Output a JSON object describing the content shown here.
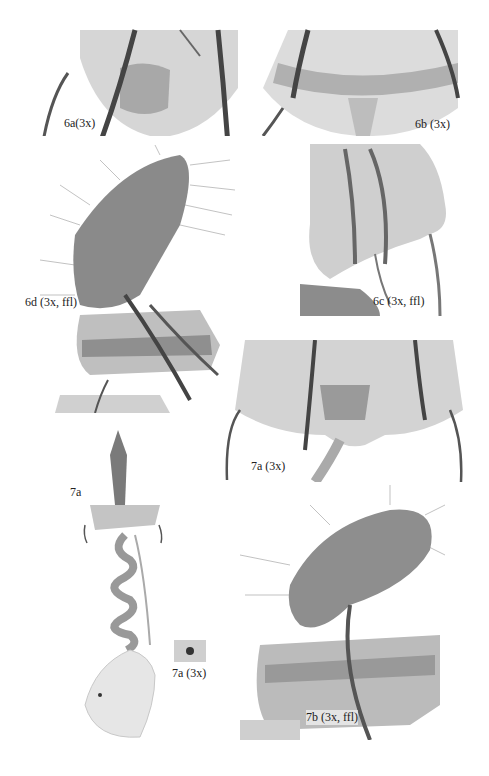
{
  "figure": {
    "panels": [
      {
        "id": "6a",
        "label": "6a(3x)"
      },
      {
        "id": "6b",
        "label": "6b (3x)"
      },
      {
        "id": "6d",
        "label": "6d (3x, ffl)"
      },
      {
        "id": "6c",
        "label": "6c (3x, ffl)"
      },
      {
        "id": "7a-3x-sterigma",
        "label": "7a (3x)"
      },
      {
        "id": "7a-whole",
        "label": "7a"
      },
      {
        "id": "7a-3x-signum",
        "label": "7a (3x)"
      },
      {
        "id": "7b",
        "label": "7b (3x, ffl)"
      }
    ]
  }
}
